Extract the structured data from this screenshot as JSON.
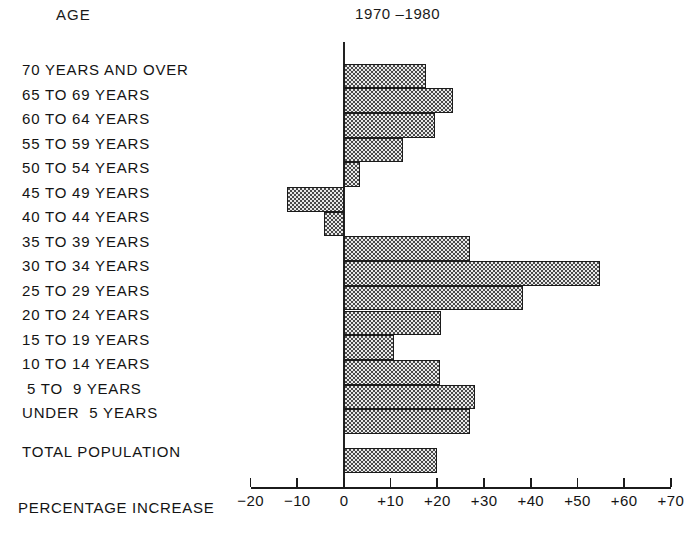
{
  "header": {
    "age_label": "AGE",
    "period_label": "1970 –1980"
  },
  "axis_caption": "PERCENTAGE INCREASE",
  "chart_data": {
    "type": "bar",
    "orientation": "horizontal",
    "title": "1970 –1980",
    "xlabel": "PERCENTAGE INCREASE",
    "ylabel": "AGE",
    "xlim": [
      -20,
      70
    ],
    "grid": false,
    "legend": null,
    "xticks": [
      -20,
      -10,
      0,
      10,
      20,
      30,
      40,
      50,
      60,
      70
    ],
    "xticklabels": [
      "−20",
      "−10",
      "0",
      "+10",
      "+20",
      "+30",
      "+40",
      "+50",
      "+60",
      "+70"
    ],
    "categories": [
      "70 YEARS AND OVER",
      "65 TO 69 YEARS",
      "60 TO 64 YEARS",
      "55 TO 59 YEARS",
      "50 TO 54 YEARS",
      "45 TO 49 YEARS",
      "40 TO 44 YEARS",
      "35 TO 39 YEARS",
      "30 TO 34 YEARS",
      "25 TO 29 YEARS",
      "20 TO 24 YEARS",
      "15 TO 19 YEARS",
      "10 TO 14 YEARS",
      "5 TO  9 YEARS",
      "UNDER  5 YEARS"
    ],
    "values": [
      17.6,
      23.3,
      19.5,
      12.7,
      3.4,
      -12.2,
      -4.3,
      27.0,
      54.8,
      38.3,
      20.7,
      10.6,
      20.6,
      28.1,
      26.9
    ],
    "summary": {
      "category": "TOTAL POPULATION",
      "value": 20.0
    }
  },
  "row_labels": [
    "70 YEARS AND OVER",
    "65 TO 69 YEARS",
    "60 TO 64 YEARS",
    "55 TO 59 YEARS",
    "50 TO 54 YEARS",
    "45 TO 49 YEARS",
    "40 TO 44 YEARS",
    "35 TO 39 YEARS",
    "30 TO 34 YEARS",
    "25 TO 29 YEARS",
    "20 TO 24 YEARS",
    "15 TO 19 YEARS",
    "10 TO 14 YEARS",
    " 5 TO  9 YEARS",
    "UNDER  5 YEARS"
  ],
  "total_label": "TOTAL POPULATION",
  "colors": {
    "ink": "#1b1b1b",
    "bar_fill": "#e9e9e9",
    "bar_stipple": "#4a4a4a",
    "background": "#ffffff"
  }
}
